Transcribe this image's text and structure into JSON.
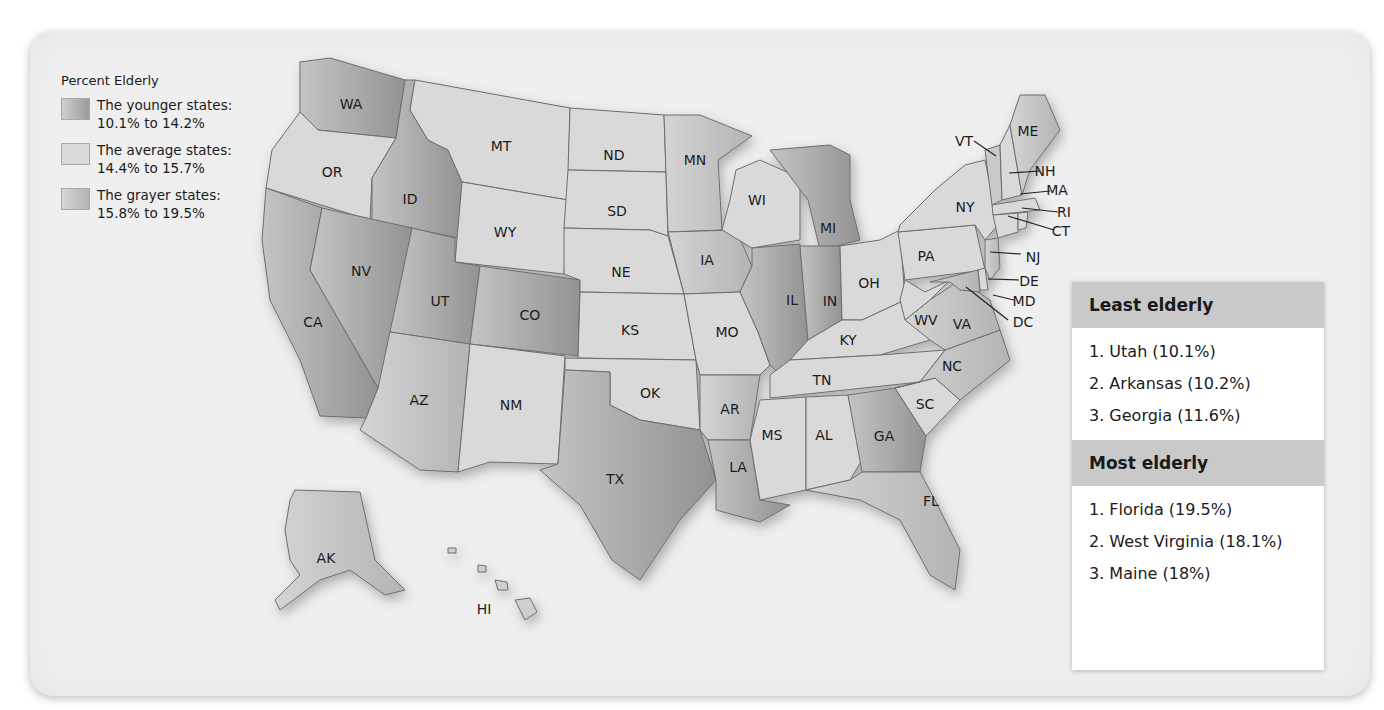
{
  "title_fragment": "",
  "legend": {
    "title": "Percent Elderly",
    "items": [
      {
        "label": "The younger states:",
        "range": "10.1% to 14.2%",
        "color": "#a6a6a6"
      },
      {
        "label": "The average states:",
        "range": "14.4% to 15.7%",
        "color": "#d7d7d7"
      },
      {
        "label": "The grayer states:",
        "range": "15.8% to 19.5%",
        "color": "#c0c0c0"
      }
    ]
  },
  "states": {
    "WA": "WA",
    "OR": "OR",
    "CA": "CA",
    "ID": "ID",
    "NV": "NV",
    "MT": "MT",
    "WY": "WY",
    "UT": "UT",
    "AZ": "AZ",
    "CO": "CO",
    "NM": "NM",
    "ND": "ND",
    "SD": "SD",
    "NE": "NE",
    "KS": "KS",
    "OK": "OK",
    "TX": "TX",
    "MN": "MN",
    "IA": "IA",
    "MO": "MO",
    "AR": "AR",
    "LA": "LA",
    "WI": "WI",
    "IL": "IL",
    "MI": "MI",
    "IN": "IN",
    "OH": "OH",
    "KY": "KY",
    "TN": "TN",
    "MS": "MS",
    "AL": "AL",
    "GA": "GA",
    "FL": "FL",
    "SC": "SC",
    "NC": "NC",
    "VA": "VA",
    "WV": "WV",
    "PA": "PA",
    "NY": "NY",
    "VT": "VT",
    "NH": "NH",
    "ME": "ME",
    "MA": "MA",
    "RI": "RI",
    "CT": "CT",
    "NJ": "NJ",
    "DE": "DE",
    "MD": "MD",
    "DC": "DC",
    "AK": "AK",
    "HI": "HI"
  },
  "least_elderly": {
    "title": "Least elderly",
    "items": [
      "1.  Utah (10.1%)",
      "2.  Arkansas (10.2%)",
      "3.  Georgia (11.6%)"
    ]
  },
  "most_elderly": {
    "title": "Most elderly",
    "items": [
      "1.  Florida (19.5%)",
      "2.  West Virginia (18.1%)",
      "3.  Maine (18%)"
    ]
  },
  "colors": {
    "younger": "#a6a6a6",
    "average": "#d9d9d9",
    "grayer": "#bfbfbf",
    "panel_bg": "#efefef",
    "rank_header": "#c9c9c9"
  }
}
